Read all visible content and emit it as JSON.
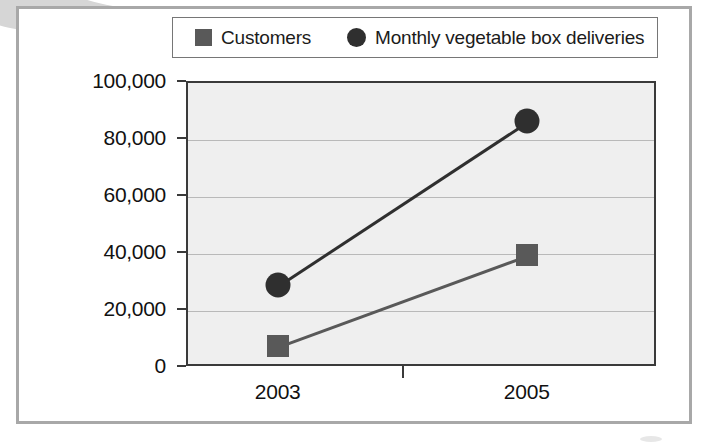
{
  "legend": {
    "items": [
      {
        "label": "Customers",
        "marker": "square-marker-icon",
        "color": "#595959"
      },
      {
        "label": "Monthly vegetable box deliveries",
        "marker": "circle-marker-icon",
        "color": "#2f2f2f"
      }
    ]
  },
  "chart_data": {
    "type": "line",
    "title": "",
    "xlabel": "",
    "ylabel": "",
    "categories": [
      "2003",
      "2005"
    ],
    "ytick_labels": [
      "0",
      "20,000",
      "40,000",
      "60,000",
      "80,000",
      "100,000"
    ],
    "ytick_values": [
      0,
      20000,
      40000,
      60000,
      80000,
      100000
    ],
    "ylim": [
      0,
      100000
    ],
    "grid": true,
    "legend_position": "top",
    "series": [
      {
        "name": "Customers",
        "values": [
          7000,
          39000
        ],
        "marker": "square",
        "color": "#595959"
      },
      {
        "name": "Monthly vegetable box deliveries",
        "values": [
          28500,
          86000
        ],
        "marker": "circle",
        "color": "#2f2f2f"
      }
    ]
  }
}
